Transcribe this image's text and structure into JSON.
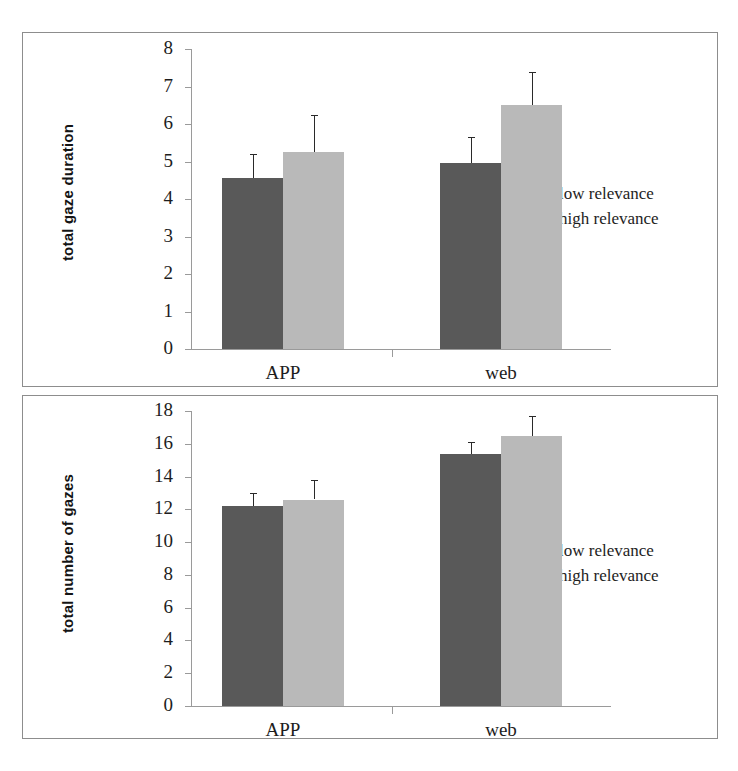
{
  "figure": {
    "panels": [
      {
        "id": "top",
        "ylabel": "total gaze duration",
        "yticks": [
          "8",
          "7",
          "6",
          "5",
          "4",
          "3",
          "2",
          "1",
          "0"
        ],
        "categories": [
          "APP",
          "web"
        ],
        "legend": [
          {
            "label": "low relevance",
            "color": "#595959"
          },
          {
            "label": "high relevance",
            "color": "#b9b9b9"
          }
        ]
      },
      {
        "id": "bottom",
        "ylabel": "total number of gazes",
        "yticks": [
          "18",
          "16",
          "14",
          "12",
          "10",
          "8",
          "6",
          "4",
          "2",
          "0"
        ],
        "categories": [
          "APP",
          "web"
        ],
        "legend": [
          {
            "label": "low relevance",
            "color": "#595959"
          },
          {
            "label": "high relevance",
            "color": "#b9b9b9"
          }
        ]
      }
    ]
  },
  "chart_data": [
    {
      "type": "bar",
      "title": "",
      "xlabel": "",
      "ylabel": "total gaze duration",
      "categories": [
        "APP",
        "web"
      ],
      "ylim": [
        0,
        8
      ],
      "ytick_values": [
        0,
        1,
        2,
        3,
        4,
        5,
        6,
        7,
        8
      ],
      "grid": false,
      "legend_position": "right",
      "error_bars": "upper only",
      "series": [
        {
          "name": "low relevance",
          "color": "#595959",
          "values": [
            4.55,
            4.95
          ],
          "error_upper": [
            0.65,
            0.7
          ]
        },
        {
          "name": "high relevance",
          "color": "#b9b9b9",
          "values": [
            5.25,
            6.5
          ],
          "error_upper": [
            1.0,
            0.9
          ]
        }
      ]
    },
    {
      "type": "bar",
      "title": "",
      "xlabel": "",
      "ylabel": "total number of gazes",
      "categories": [
        "APP",
        "web"
      ],
      "ylim": [
        0,
        18
      ],
      "ytick_values": [
        0,
        2,
        4,
        6,
        8,
        10,
        12,
        14,
        16,
        18
      ],
      "grid": false,
      "legend_position": "right",
      "error_bars": "upper only",
      "series": [
        {
          "name": "low relevance",
          "color": "#595959",
          "values": [
            12.2,
            15.4
          ],
          "error_upper": [
            0.8,
            0.7
          ]
        },
        {
          "name": "high relevance",
          "color": "#b9b9b9",
          "values": [
            12.6,
            16.5
          ],
          "error_upper": [
            1.2,
            1.2
          ]
        }
      ]
    }
  ]
}
